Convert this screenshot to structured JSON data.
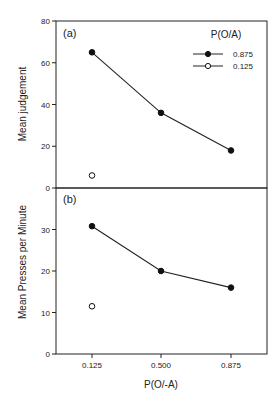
{
  "chart_data": [
    {
      "panel_label": "(a)",
      "type": "line",
      "title": "",
      "xlabel": "",
      "ylabel": "Mean judgement",
      "ylim": [
        0,
        80
      ],
      "yticks": [
        0,
        20,
        40,
        60,
        80
      ],
      "categories": [
        "0.125",
        "0.500",
        "0.875"
      ],
      "legend": {
        "title": "P(O/A)",
        "position": "upper right",
        "entries": [
          {
            "label": "0.875",
            "marker": "filled-circle",
            "line": true
          },
          {
            "label": "0.125",
            "marker": "open-circle",
            "line": true
          }
        ]
      },
      "series": [
        {
          "name": "0.875",
          "marker": "filled-circle",
          "values": [
            65,
            36,
            18
          ]
        },
        {
          "name": "0.125",
          "marker": "open-circle",
          "values": [
            6,
            null,
            null
          ]
        }
      ],
      "grid": false
    },
    {
      "panel_label": "(b)",
      "type": "line",
      "title": "",
      "xlabel": "P(O/-A)",
      "ylabel": "Mean Presses per Minute",
      "ylim": [
        0,
        40
      ],
      "yticks": [
        0,
        10,
        20,
        30
      ],
      "categories": [
        "0.125",
        "0.500",
        "0.875"
      ],
      "series": [
        {
          "name": "0.875",
          "marker": "filled-circle",
          "values": [
            30.8,
            20,
            16
          ]
        },
        {
          "name": "0.125",
          "marker": "open-circle",
          "values": [
            11.5,
            null,
            null
          ]
        }
      ],
      "grid": false
    }
  ],
  "labels": {
    "panel_a": "(a)",
    "panel_b": "(b)",
    "ylabel_a": "Mean judgement",
    "ylabel_b": "Mean Presses per Minute",
    "xlabel": "P(O/-A)",
    "legend_title": "P(O/A)",
    "legend_filled": "0.875",
    "legend_open": "0.125"
  }
}
